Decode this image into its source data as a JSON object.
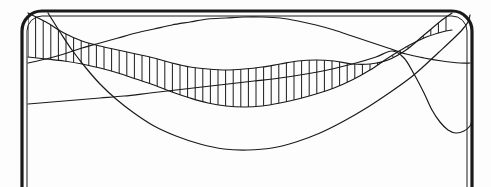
{
  "figure": {
    "background_color": "#fdfdfd",
    "stroke_color": "#1a1a1a",
    "frame": {
      "name": "rounded-rectangle-frame",
      "outer_stroke_width": 3.2,
      "inner_stroke_width": 1.0,
      "corner_radius": 20,
      "x": 22,
      "y": 11,
      "width": 450,
      "height": 200,
      "inner_inset": 5
    }
  },
  "chart_data": {
    "type": "line",
    "xlabel": "",
    "ylabel": "",
    "xlim": [
      0,
      491
    ],
    "ylim": [
      187,
      0
    ],
    "grid": false,
    "legend": false,
    "hatch": {
      "name": "vertical-hatch-band",
      "spacing": 7.6,
      "stroke_width": 1.0,
      "x_start": 28,
      "x_end": 452,
      "upper_series": "band_upper",
      "lower_series": "band_lower"
    },
    "series": [
      {
        "name": "band_upper",
        "role": "hatch-band-upper-envelope",
        "stroke_width": 1.2,
        "points": [
          [
            28,
            13
          ],
          [
            46,
            22
          ],
          [
            64,
            33
          ],
          [
            82,
            41
          ],
          [
            100,
            46
          ],
          [
            118,
            50
          ],
          [
            136,
            54
          ],
          [
            154,
            58
          ],
          [
            172,
            63
          ],
          [
            190,
            67
          ],
          [
            208,
            69
          ],
          [
            226,
            70
          ],
          [
            244,
            69
          ],
          [
            262,
            67
          ],
          [
            280,
            64
          ],
          [
            298,
            61
          ],
          [
            316,
            60
          ],
          [
            334,
            61
          ],
          [
            352,
            64
          ],
          [
            370,
            64
          ],
          [
            388,
            60
          ],
          [
            406,
            50
          ],
          [
            424,
            35
          ],
          [
            442,
            20
          ],
          [
            452,
            13
          ]
        ]
      },
      {
        "name": "band_lower",
        "role": "hatch-band-lower-envelope",
        "stroke_width": 1.2,
        "points": [
          [
            28,
            57
          ],
          [
            46,
            59
          ],
          [
            64,
            61
          ],
          [
            82,
            64
          ],
          [
            100,
            68
          ],
          [
            118,
            73
          ],
          [
            136,
            79
          ],
          [
            154,
            85
          ],
          [
            172,
            92
          ],
          [
            190,
            98
          ],
          [
            208,
            103
          ],
          [
            226,
            106
          ],
          [
            244,
            107
          ],
          [
            262,
            106
          ],
          [
            280,
            103
          ],
          [
            298,
            99
          ],
          [
            316,
            94
          ],
          [
            334,
            88
          ],
          [
            352,
            80
          ],
          [
            370,
            70
          ],
          [
            388,
            58
          ],
          [
            406,
            47
          ],
          [
            424,
            38
          ],
          [
            442,
            32
          ],
          [
            452,
            30
          ]
        ]
      },
      {
        "name": "arch_curve",
        "role": "top-arch-sine",
        "stroke_width": 1.2,
        "points": [
          [
            28,
            63
          ],
          [
            46,
            59
          ],
          [
            64,
            54
          ],
          [
            82,
            48
          ],
          [
            100,
            43
          ],
          [
            118,
            38
          ],
          [
            136,
            33
          ],
          [
            154,
            29
          ],
          [
            172,
            25
          ],
          [
            190,
            22
          ],
          [
            208,
            19
          ],
          [
            226,
            18
          ],
          [
            244,
            17
          ],
          [
            262,
            17
          ],
          [
            280,
            18
          ],
          [
            298,
            21
          ],
          [
            316,
            25
          ],
          [
            334,
            30
          ],
          [
            352,
            36
          ],
          [
            370,
            42
          ],
          [
            388,
            48
          ],
          [
            406,
            54
          ],
          [
            424,
            58
          ],
          [
            442,
            61
          ],
          [
            460,
            63
          ],
          [
            470,
            63
          ]
        ]
      },
      {
        "name": "descending_curve",
        "role": "steep-descending-sine",
        "stroke_width": 1.2,
        "points": [
          [
            48,
            13
          ],
          [
            60,
            32
          ],
          [
            72,
            50
          ],
          [
            86,
            68
          ],
          [
            100,
            84
          ],
          [
            116,
            99
          ],
          [
            134,
            113
          ],
          [
            154,
            126
          ],
          [
            176,
            136
          ],
          [
            200,
            144
          ],
          [
            224,
            149
          ],
          [
            248,
            150
          ],
          [
            272,
            148
          ],
          [
            296,
            142
          ],
          [
            320,
            133
          ],
          [
            344,
            121
          ],
          [
            368,
            107
          ],
          [
            392,
            91
          ],
          [
            410,
            78
          ],
          [
            424,
            66
          ],
          [
            438,
            53
          ],
          [
            452,
            40
          ],
          [
            462,
            30
          ],
          [
            468,
            22
          ],
          [
            470,
            15
          ]
        ]
      },
      {
        "name": "valley_curve",
        "role": "right-valley-sine",
        "stroke_width": 1.2,
        "points": [
          [
            28,
            104
          ],
          [
            52,
            102
          ],
          [
            76,
            100
          ],
          [
            100,
            98
          ],
          [
            124,
            96
          ],
          [
            150,
            93
          ],
          [
            176,
            90
          ],
          [
            202,
            87
          ],
          [
            228,
            84
          ],
          [
            254,
            81
          ],
          [
            280,
            78
          ],
          [
            306,
            74
          ],
          [
            332,
            69
          ],
          [
            356,
            63
          ],
          [
            376,
            57
          ],
          [
            392,
            51
          ],
          [
            404,
            58
          ],
          [
            414,
            74
          ],
          [
            424,
            93
          ],
          [
            432,
            110
          ],
          [
            440,
            122
          ],
          [
            448,
            130
          ],
          [
            456,
            133
          ],
          [
            464,
            131
          ],
          [
            470,
            126
          ],
          [
            472,
            121
          ]
        ]
      }
    ]
  }
}
